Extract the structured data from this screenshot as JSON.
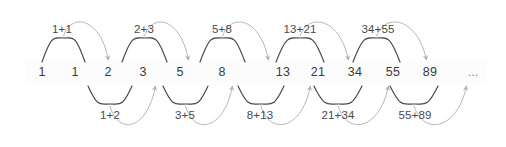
{
  "diagram": {
    "colors": {
      "background": "#ffffff",
      "number_text": "#3a3a3a",
      "label_text": "#4a4a4a",
      "pair_arc": "#4a4a4a",
      "result_arrow": "#b7b7b7",
      "ellipsis": "#8d8d8d"
    },
    "sequence": {
      "label": "fibonacci-sequence",
      "terms": [
        {
          "value": "1",
          "x": 42
        },
        {
          "value": "1",
          "x": 75
        },
        {
          "value": "2",
          "x": 108
        },
        {
          "value": "3",
          "x": 143
        },
        {
          "value": "5",
          "x": 180
        },
        {
          "value": "8",
          "x": 222
        },
        {
          "value": "13",
          "x": 283
        },
        {
          "value": "21",
          "x": 318
        },
        {
          "value": "34",
          "x": 355
        },
        {
          "value": "55",
          "x": 393
        },
        {
          "value": "89",
          "x": 430
        }
      ],
      "continuation": {
        "value": "...",
        "x": 473
      }
    },
    "top_sums": [
      {
        "label": "1+1",
        "addends": [
          1,
          1
        ],
        "result": 2,
        "from_index": 0,
        "to_index": 1,
        "target_index": 2,
        "label_x": 62,
        "arc_x1": 42,
        "arc_x2": 85,
        "arrow_to_x": 108
      },
      {
        "label": "2+3",
        "addends": [
          2,
          3
        ],
        "result": 5,
        "from_index": 2,
        "to_index": 3,
        "target_index": 4,
        "label_x": 144,
        "arc_x1": 122,
        "arc_x2": 167,
        "arrow_to_x": 188
      },
      {
        "label": "5+8",
        "addends": [
          5,
          8
        ],
        "result": 13,
        "from_index": 4,
        "to_index": 5,
        "target_index": 6,
        "label_x": 222,
        "arc_x1": 200,
        "arc_x2": 245,
        "arrow_to_x": 268
      },
      {
        "label": "13+21",
        "addends": [
          13,
          21
        ],
        "result": 34,
        "from_index": 6,
        "to_index": 7,
        "target_index": 8,
        "label_x": 300,
        "arc_x1": 276,
        "arc_x2": 324,
        "arrow_to_x": 348
      },
      {
        "label": "34+55",
        "addends": [
          34,
          55
        ],
        "result": 89,
        "from_index": 8,
        "to_index": 9,
        "target_index": 10,
        "label_x": 378,
        "arc_x1": 353,
        "arc_x2": 400,
        "arrow_to_x": 426
      }
    ],
    "bottom_sums": [
      {
        "label": "1+2",
        "addends": [
          1,
          2
        ],
        "result": 3,
        "from_index": 1,
        "to_index": 2,
        "target_index": 3,
        "label_x": 110,
        "arc_x1": 88,
        "arc_x2": 132,
        "arrow_to_x": 155
      },
      {
        "label": "3+5",
        "addends": [
          3,
          5
        ],
        "result": 8,
        "from_index": 3,
        "to_index": 4,
        "target_index": 5,
        "label_x": 185,
        "arc_x1": 163,
        "arc_x2": 208,
        "arrow_to_x": 232
      },
      {
        "label": "8+13",
        "addends": [
          8,
          13
        ],
        "result": 21,
        "from_index": 5,
        "to_index": 6,
        "target_index": 7,
        "label_x": 260,
        "arc_x1": 238,
        "arc_x2": 284,
        "arrow_to_x": 310
      },
      {
        "label": "21+34",
        "addends": [
          21,
          34
        ],
        "result": 55,
        "from_index": 7,
        "to_index": 8,
        "target_index": 9,
        "label_x": 338,
        "arc_x1": 314,
        "arc_x2": 362,
        "arrow_to_x": 388
      },
      {
        "label": "55+89",
        "addends": [
          55,
          89
        ],
        "result": 144,
        "from_index": 9,
        "to_index": 10,
        "target_index": 11,
        "label_x": 415,
        "arc_x1": 390,
        "arc_x2": 438,
        "arrow_to_x": 466
      }
    ],
    "geometry": {
      "baseline_y": 72,
      "top_arc_peak_y": 38,
      "top_long_peak_y": 12,
      "top_arrow_y": 58,
      "bottom_arc_valley_y": 104,
      "bottom_long_valley_y": 136,
      "bottom_arrow_y": 88
    }
  }
}
